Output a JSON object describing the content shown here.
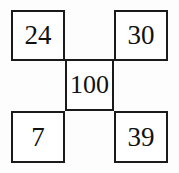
{
  "diagram": {
    "type": "number-puzzle-grid",
    "layout": "quincunx",
    "background_color": "#fdfdfd",
    "border_color": "#1a1a1a",
    "text_color": "#111111",
    "cells": {
      "top_left": "24",
      "top_right": "30",
      "center": "100",
      "bottom_left": "7",
      "bottom_right": "39"
    }
  }
}
